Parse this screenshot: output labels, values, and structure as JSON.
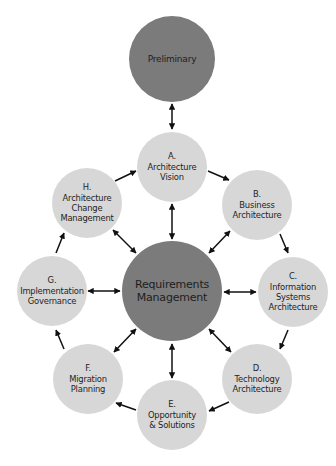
{
  "diagram": {
    "colors": {
      "core_fill": "#7b7b7b",
      "phase_fill": "#d7d7d7",
      "arrow": "#111111",
      "text": "#1e1e1e"
    },
    "nodes": {
      "preliminary": {
        "lines": [
          "Preliminary"
        ]
      },
      "center": {
        "lines": [
          "Requirements",
          "Management"
        ]
      },
      "a": {
        "lines": [
          "A.",
          "Architecture",
          "Vision"
        ]
      },
      "b": {
        "lines": [
          "B.",
          "Business",
          "Architecture"
        ]
      },
      "c": {
        "lines": [
          "C.",
          "Information",
          "Systems",
          "Architecture"
        ]
      },
      "d": {
        "lines": [
          "D.",
          "Technology",
          "Architecture"
        ]
      },
      "e": {
        "lines": [
          "E.",
          "Opportunity",
          "& Solutions"
        ]
      },
      "f": {
        "lines": [
          "F.",
          "Migration",
          "Planning"
        ]
      },
      "g": {
        "lines": [
          "G.",
          "Implementation",
          "Governance"
        ]
      },
      "h": {
        "lines": [
          "H.",
          "Architecture",
          "Change",
          "Management"
        ]
      }
    },
    "edges": [
      {
        "from": "Preliminary",
        "to": "A. Architecture Vision",
        "type": "bidirectional"
      },
      {
        "from": "A. Architecture Vision",
        "to": "B. Business Architecture",
        "type": "directed"
      },
      {
        "from": "B. Business Architecture",
        "to": "C. Information Systems Architecture",
        "type": "directed"
      },
      {
        "from": "C. Information Systems Architecture",
        "to": "D. Technology Architecture",
        "type": "directed"
      },
      {
        "from": "D. Technology Architecture",
        "to": "E. Opportunity & Solutions",
        "type": "directed"
      },
      {
        "from": "E. Opportunity & Solutions",
        "to": "F. Migration Planning",
        "type": "directed"
      },
      {
        "from": "F. Migration Planning",
        "to": "G. Implementation Governance",
        "type": "directed"
      },
      {
        "from": "G. Implementation Governance",
        "to": "H. Architecture Change Management",
        "type": "directed"
      },
      {
        "from": "H. Architecture Change Management",
        "to": "A. Architecture Vision",
        "type": "directed"
      },
      {
        "from": "Requirements Management",
        "to": "A. Architecture Vision",
        "type": "bidirectional"
      },
      {
        "from": "Requirements Management",
        "to": "B. Business Architecture",
        "type": "bidirectional"
      },
      {
        "from": "Requirements Management",
        "to": "C. Information Systems Architecture",
        "type": "bidirectional"
      },
      {
        "from": "Requirements Management",
        "to": "D. Technology Architecture",
        "type": "bidirectional"
      },
      {
        "from": "Requirements Management",
        "to": "E. Opportunity & Solutions",
        "type": "bidirectional"
      },
      {
        "from": "Requirements Management",
        "to": "F. Migration Planning",
        "type": "bidirectional"
      },
      {
        "from": "Requirements Management",
        "to": "G. Implementation Governance",
        "type": "bidirectional"
      },
      {
        "from": "Requirements Management",
        "to": "H. Architecture Change Management",
        "type": "bidirectional"
      }
    ]
  }
}
